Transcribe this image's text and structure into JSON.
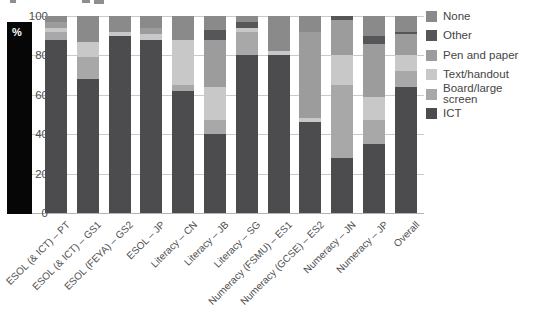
{
  "chart_data": {
    "type": "bar",
    "stacked": true,
    "title": "",
    "xlabel": "",
    "ylabel": "%",
    "grid": true,
    "legend_position": "right",
    "y_axis": {
      "label": "%",
      "min": 0,
      "max": 100,
      "ticks": [
        100,
        80,
        60,
        40,
        20,
        0
      ]
    },
    "categories": [
      "ESOL (& ICT) – PT",
      "ESOL (& ICT) – GS1",
      "ESOL (FEYA) – GS2",
      "ESOL – JP",
      "Literacy – CN",
      "Literacy – JB",
      "Literacy – SG",
      "Numeracy (FSMU) – ES1",
      "Numeracy (GCSE) – ES2",
      "Numeracy – JN",
      "Numeracy – JP",
      "Overall"
    ],
    "series": [
      {
        "name": "ICT",
        "color": "#4c4c4e",
        "values": [
          88,
          68,
          90,
          88,
          62,
          40,
          80,
          80,
          46,
          28,
          35,
          64
        ]
      },
      {
        "name": "Board/large screen",
        "color": "#a8a8a8",
        "values": [
          4,
          11,
          0,
          0,
          3,
          7,
          12,
          0,
          0,
          37,
          12,
          8
        ]
      },
      {
        "name": "Text/handout",
        "color": "#c8c8c8",
        "values": [
          2,
          8,
          2,
          3,
          23,
          17,
          2,
          2,
          2,
          15,
          12,
          8
        ]
      },
      {
        "name": "Pen and paper",
        "color": "#9c9c9c",
        "values": [
          3,
          0,
          0,
          3,
          0,
          24,
          0,
          0,
          44,
          18,
          27,
          11
        ]
      },
      {
        "name": "Other",
        "color": "#565658",
        "values": [
          0,
          0,
          0,
          0,
          0,
          5,
          3,
          0,
          0,
          2,
          4,
          1
        ]
      },
      {
        "name": "None",
        "color": "#8a8a8a",
        "values": [
          3,
          13,
          8,
          6,
          12,
          7,
          3,
          18,
          8,
          0,
          10,
          8
        ]
      }
    ],
    "legend_order": [
      "None",
      "Other",
      "Pen and paper",
      "Text/handout",
      "Board/large screen",
      "ICT"
    ]
  }
}
